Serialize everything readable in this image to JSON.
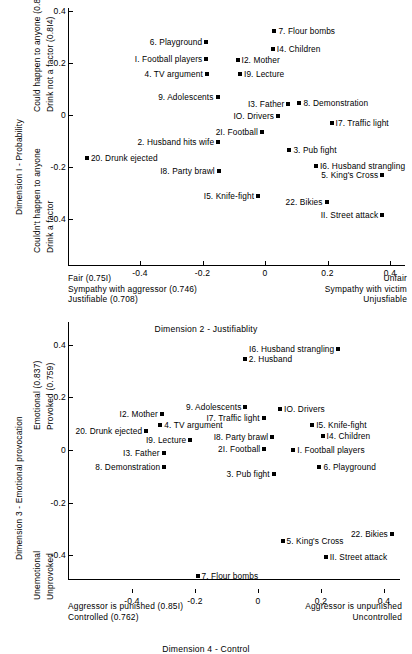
{
  "chart_data": [
    {
      "type": "scatter",
      "title": "",
      "xlabel": "Dimension 2 - Justifiablity",
      "ylabel": "Dimension I - Probability",
      "xlim": [
        -0.63,
        0.47
      ],
      "ylim": [
        -0.55,
        0.42
      ],
      "grid": false,
      "legend": "none",
      "xticks": [
        -0.4,
        -0.2,
        0,
        0.2,
        0.4
      ],
      "xticklabels": [
        "-0.4",
        "-0.2",
        "0",
        "0.2",
        "0.4"
      ],
      "yticks": [
        0.4,
        0.2,
        0,
        -0.2,
        -0.4
      ],
      "yticklabels": [
        "0.4",
        "0.2",
        "0",
        "-0.2",
        "-0.4"
      ],
      "y_axis_top_annotation": [
        "Could happen to anyone (0.837)",
        "Drink not a factor (0.8I4)"
      ],
      "y_axis_bottom_annotation": [
        "Couldn't happen to anyone",
        "Drink a factor"
      ],
      "x_axis_left_annotation": [
        "Fair (0.75I)",
        "Sympathy with aggressor (0.746)",
        "Justifiable (0.708)"
      ],
      "x_axis_right_annotation": [
        "Unfair",
        "Sympathy with victim",
        "Unjusfiable"
      ],
      "points": [
        {
          "label": "7. Flour bombs",
          "x": 0.03,
          "y": 0.325,
          "side": "right"
        },
        {
          "label": "6. Playground",
          "x": -0.188,
          "y": 0.281,
          "side": "left"
        },
        {
          "label": "I4. Children",
          "x": 0.025,
          "y": 0.255,
          "side": "right"
        },
        {
          "label": "I. Football players",
          "x": -0.188,
          "y": 0.215,
          "side": "left"
        },
        {
          "label": "I2. Mother",
          "x": -0.088,
          "y": 0.212,
          "side": "right"
        },
        {
          "label": "4. TV argument",
          "x": -0.186,
          "y": 0.157,
          "side": "left"
        },
        {
          "label": "I9. Lecture",
          "x": -0.08,
          "y": 0.158,
          "side": "right"
        },
        {
          "label": "9. Adolescents",
          "x": -0.152,
          "y": 0.068,
          "side": "left"
        },
        {
          "label": "I3. Father",
          "x": 0.075,
          "y": 0.043,
          "side": "left"
        },
        {
          "label": "8. Demonstration",
          "x": 0.11,
          "y": 0.048,
          "side": "right"
        },
        {
          "label": "IO. Drivers",
          "x": 0.042,
          "y": -0.002,
          "side": "left"
        },
        {
          "label": "I7. Traffic light",
          "x": 0.213,
          "y": -0.03,
          "side": "right"
        },
        {
          "label": "2I. Football",
          "x": -0.01,
          "y": -0.065,
          "side": "left"
        },
        {
          "label": "2. Husband hits wife",
          "x": -0.15,
          "y": -0.103,
          "side": "left"
        },
        {
          "label": "3. Pub fight",
          "x": 0.078,
          "y": -0.135,
          "side": "right"
        },
        {
          "label": "20. Drunk ejected",
          "x": -0.57,
          "y": -0.165,
          "side": "right"
        },
        {
          "label": "I6. Husband strangling",
          "x": 0.163,
          "y": -0.195,
          "side": "right"
        },
        {
          "label": "I8. Party brawl",
          "x": -0.148,
          "y": -0.215,
          "side": "left"
        },
        {
          "label": "5. King's Cross",
          "x": 0.375,
          "y": -0.232,
          "side": "left"
        },
        {
          "label": "I5. Knife-fight",
          "x": -0.022,
          "y": -0.31,
          "side": "left"
        },
        {
          "label": "22. Bikies",
          "x": 0.197,
          "y": -0.335,
          "side": "left"
        },
        {
          "label": "II. Street attack",
          "x": 0.375,
          "y": -0.383,
          "side": "left"
        }
      ]
    },
    {
      "type": "scatter",
      "title": "",
      "xlabel": "Dimension 4 - Control",
      "ylabel": "Dimension 3 - Emotional provocation",
      "xlim": [
        -0.62,
        0.47
      ],
      "ylim": [
        -0.56,
        0.44
      ],
      "grid": false,
      "legend": "none",
      "xticks": [
        -0.4,
        -0.2,
        0,
        0.2,
        0.4
      ],
      "xticklabels": [
        "-0.4",
        "-0.2",
        "0",
        "0.2",
        "0.4"
      ],
      "yticks": [
        0.4,
        0.2,
        0,
        -0.2,
        -0.4
      ],
      "yticklabels": [
        "0.4",
        "0.2",
        "0",
        "-0.2",
        "-0.4"
      ],
      "y_axis_top_annotation": [
        "Emotional (0.837)",
        "Provoked (0.759)"
      ],
      "y_axis_bottom_annotation": [
        "Unemotional",
        "Unprovoked"
      ],
      "x_axis_left_annotation": [
        "Aggressor is punished (0.85I)",
        "Controlled (0.762)"
      ],
      "x_axis_right_annotation": [
        "Aggressor is unpunished",
        "Uncontrolled"
      ],
      "points": [
        {
          "label": "I6. Husband strangling",
          "x": 0.255,
          "y": 0.385,
          "side": "left"
        },
        {
          "label": "2. Husband",
          "x": -0.042,
          "y": 0.345,
          "side": "right"
        },
        {
          "label": "9. Adolescents",
          "x": -0.04,
          "y": 0.163,
          "side": "left"
        },
        {
          "label": "IO. Drivers",
          "x": 0.07,
          "y": 0.155,
          "side": "right"
        },
        {
          "label": "I2. Mother",
          "x": -0.305,
          "y": 0.138,
          "side": "left"
        },
        {
          "label": "I7. Traffic light",
          "x": 0.018,
          "y": 0.12,
          "side": "left"
        },
        {
          "label": "I5. Knife-fight",
          "x": 0.172,
          "y": 0.095,
          "side": "right"
        },
        {
          "label": "20. Drunk ejected",
          "x": -0.355,
          "y": 0.072,
          "side": "left"
        },
        {
          "label": "4. TV argument",
          "x": -0.31,
          "y": 0.095,
          "side": "right"
        },
        {
          "label": "I8. Party brawl",
          "x": 0.045,
          "y": 0.05,
          "side": "left"
        },
        {
          "label": "I4. Children",
          "x": 0.205,
          "y": 0.052,
          "side": "right"
        },
        {
          "label": "I9. Lecture",
          "x": -0.215,
          "y": 0.037,
          "side": "left"
        },
        {
          "label": "2I. Football",
          "x": 0.02,
          "y": 0.003,
          "side": "left"
        },
        {
          "label": "I. Football players",
          "x": 0.112,
          "y": 0.0,
          "side": "right"
        },
        {
          "label": "I3. Father",
          "x": -0.3,
          "y": -0.01,
          "side": "left"
        },
        {
          "label": "6. Playground",
          "x": 0.195,
          "y": -0.065,
          "side": "right"
        },
        {
          "label": "8. Demonstration",
          "x": -0.298,
          "y": -0.065,
          "side": "left"
        },
        {
          "label": "3. Pub fight",
          "x": 0.05,
          "y": -0.093,
          "side": "left"
        },
        {
          "label": "22. Bikies",
          "x": 0.425,
          "y": -0.318,
          "side": "left"
        },
        {
          "label": "5. King's Cross",
          "x": 0.078,
          "y": -0.345,
          "side": "right"
        },
        {
          "label": "II. Street attack",
          "x": 0.215,
          "y": -0.405,
          "side": "right"
        },
        {
          "label": "7. Flour bombs",
          "x": -0.192,
          "y": -0.478,
          "side": "right"
        }
      ]
    }
  ]
}
